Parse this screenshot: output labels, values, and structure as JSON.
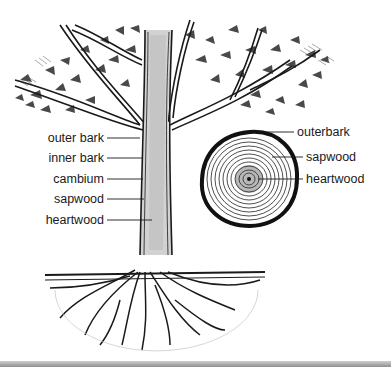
{
  "diagram": {
    "trunk_labels": [
      {
        "label": "outer bark",
        "y": 138
      },
      {
        "label": "inner bark",
        "y": 158
      },
      {
        "label": "cambium",
        "y": 179
      },
      {
        "label": "sapwood",
        "y": 199
      },
      {
        "label": "heartwood",
        "y": 220
      }
    ],
    "cross_section_labels": [
      {
        "label": "outerbark",
        "y": 132
      },
      {
        "label": "sapwood",
        "y": 157
      },
      {
        "label": "heartwood",
        "y": 179
      }
    ],
    "colors": {
      "ink": "#1a1a1a",
      "trunk_shade": "#cfcfcf",
      "background": "#ffffff"
    }
  }
}
